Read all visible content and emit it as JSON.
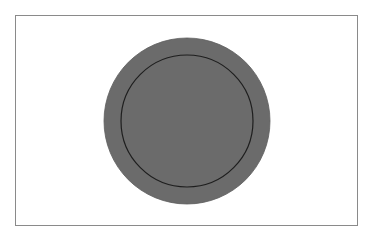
{
  "figure": {
    "frame": {
      "x": 15,
      "y": 15,
      "width": 343,
      "height": 211,
      "stroke": "#8a8a8a"
    },
    "outer_circle": {
      "cx": 187,
      "cy": 121,
      "r": 83,
      "fill": "#6b6b6b",
      "stroke": "#5e5e5e"
    },
    "inner_circle": {
      "cx": 187,
      "cy": 121,
      "r": 66,
      "fill": "none",
      "stroke": "#1e1e1e",
      "stroke_width": 1.2
    },
    "background": "#ffffff"
  }
}
